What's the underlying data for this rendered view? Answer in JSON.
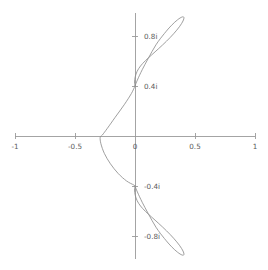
{
  "figure": {
    "title": "",
    "background_color": "#ffffff",
    "width": 268,
    "height": 270
  },
  "axes": {
    "origin_px": {
      "x": 135,
      "y": 136
    },
    "x_scale_px_per_unit": 120,
    "y_scale_px_per_unit": 125,
    "axis_color": "#9a9a9a",
    "tick_label_color": "#5b5b5b",
    "x_axis_label": "",
    "y_axis_label": "",
    "x_ticks": [
      {
        "value": -1,
        "label": "-1"
      },
      {
        "value": -0.5,
        "label": "-0.5"
      },
      {
        "value": 0,
        "label": "0"
      },
      {
        "value": 0.5,
        "label": "0.5"
      },
      {
        "value": 1,
        "label": "1"
      }
    ],
    "y_ticks": [
      {
        "value": 0.8,
        "label": "0.8i"
      },
      {
        "value": 0.4,
        "label": "0.4i"
      },
      {
        "value": -0.4,
        "label": "-0.4i"
      },
      {
        "value": -0.8,
        "label": "-0.8i"
      }
    ]
  },
  "chart_data": {
    "type": "line",
    "title": "",
    "xlabel": "",
    "ylabel": "",
    "xlim": [
      -1,
      1
    ],
    "ylim": [
      -1.0,
      1.0
    ],
    "grid": false,
    "legend": "none",
    "curve_color": "#8e8e8e",
    "series": [
      {
        "name": "curve",
        "closed": true,
        "x": [
          0.0,
          0.02,
          0.06,
          0.11,
          0.175,
          0.245,
          0.305,
          0.355,
          0.392,
          0.408,
          0.4,
          0.37,
          0.322,
          0.262,
          0.198,
          0.138,
          0.086,
          0.046,
          0.018,
          0.002,
          -0.004,
          0.0,
          0.0,
          -0.03,
          -0.09,
          -0.165,
          -0.23,
          -0.272,
          -0.29,
          -0.284,
          -0.255,
          -0.205,
          -0.14,
          -0.07,
          -0.01,
          0.0,
          0.0,
          -0.004,
          0.002,
          0.018,
          0.046,
          0.086,
          0.138,
          0.198,
          0.262,
          0.322,
          0.37,
          0.4,
          0.408,
          0.392,
          0.355,
          0.305,
          0.245,
          0.175,
          0.11,
          0.06,
          0.02,
          0.0
        ],
        "y": [
          0.4,
          0.448,
          0.53,
          0.62,
          0.73,
          0.82,
          0.886,
          0.93,
          0.952,
          0.948,
          0.92,
          0.874,
          0.818,
          0.758,
          0.7,
          0.648,
          0.602,
          0.56,
          0.518,
          0.474,
          0.432,
          0.4,
          0.4,
          0.34,
          0.25,
          0.15,
          0.062,
          0.008,
          -0.01,
          -0.062,
          -0.14,
          -0.222,
          -0.3,
          -0.36,
          -0.392,
          -0.4,
          -0.4,
          -0.432,
          -0.474,
          -0.518,
          -0.56,
          -0.602,
          -0.648,
          -0.7,
          -0.758,
          -0.818,
          -0.874,
          -0.92,
          -0.948,
          -0.952,
          -0.93,
          -0.886,
          -0.82,
          -0.73,
          -0.62,
          -0.53,
          -0.448,
          -0.4
        ]
      }
    ]
  }
}
